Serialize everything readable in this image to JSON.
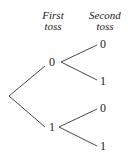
{
  "headers": {
    "first": [
      "First",
      "toss"
    ],
    "second": [
      "Second",
      "toss"
    ]
  },
  "tree": {
    "first_toss": [
      {
        "label": "0",
        "second_toss": [
          "0",
          "1"
        ]
      },
      {
        "label": "1",
        "second_toss": [
          "0",
          "1"
        ]
      }
    ]
  },
  "colors": {
    "line": "#333333",
    "text": "#222222"
  }
}
